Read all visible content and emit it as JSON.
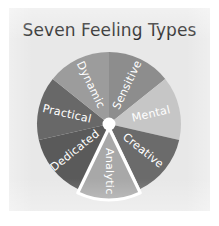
{
  "page": {
    "background_color": "#ffffff",
    "panel_color": "#e8e8e8"
  },
  "header": {
    "title": "Seven Feeling Types",
    "title_color": "#2b2b2b"
  },
  "chart_data": {
    "type": "pie",
    "title": "Seven Feeling Types",
    "xlabel": "",
    "ylabel": "",
    "legend_position": "none",
    "grid": false,
    "label_color": "#ffffff",
    "start_angle_deg": 0,
    "direction": "clockwise",
    "exploded_slice": "Analytic",
    "center_hub_color": "#ffffff",
    "categories": [
      "Sensitive",
      "Mental",
      "Creative",
      "Analytic",
      "Dedicated",
      "Practical",
      "Dynamic"
    ],
    "values": [
      14.3,
      14.3,
      14.3,
      14.3,
      14.3,
      14.3,
      14.3
    ],
    "colors": [
      "#8d8d8d",
      "#c6c6c6",
      "#6b6b6b",
      "#a8a8a8",
      "#5a5a5a",
      "#686868",
      "#9c9c9c"
    ],
    "slices": [
      {
        "label": "Sensitive",
        "value": 14.3,
        "color": "#8d8d8d",
        "start_deg": 0,
        "end_deg": 51.4,
        "exploded": false
      },
      {
        "label": "Mental",
        "value": 14.3,
        "color": "#c6c6c6",
        "start_deg": 51.4,
        "end_deg": 102.9,
        "exploded": false
      },
      {
        "label": "Creative",
        "value": 14.3,
        "color": "#6b6b6b",
        "start_deg": 102.9,
        "end_deg": 154.3,
        "exploded": false
      },
      {
        "label": "Analytic",
        "value": 14.3,
        "color": "#a8a8a8",
        "start_deg": 154.3,
        "end_deg": 205.7,
        "exploded": true
      },
      {
        "label": "Dedicated",
        "value": 14.3,
        "color": "#5a5a5a",
        "start_deg": 205.7,
        "end_deg": 257.1,
        "exploded": false
      },
      {
        "label": "Practical",
        "value": 14.3,
        "color": "#686868",
        "start_deg": 257.1,
        "end_deg": 308.6,
        "exploded": false
      },
      {
        "label": "Dynamic",
        "value": 14.3,
        "color": "#9c9c9c",
        "start_deg": 308.6,
        "end_deg": 360,
        "exploded": false
      }
    ]
  }
}
